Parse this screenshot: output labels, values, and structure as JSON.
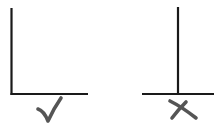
{
  "figures": [
    {
      "id": "correct",
      "description": "Vertical line meeting horizontal line at its left end (L-shape)",
      "mark": "check",
      "mark_label": "correct",
      "colors": {
        "line": "#1a1a1a",
        "mark": "#555555"
      }
    },
    {
      "id": "incorrect",
      "description": "Vertical line meeting horizontal line in its middle (inverted T-shape)",
      "mark": "cross",
      "mark_label": "incorrect",
      "colors": {
        "line": "#1a1a1a",
        "mark": "#555555"
      }
    }
  ]
}
